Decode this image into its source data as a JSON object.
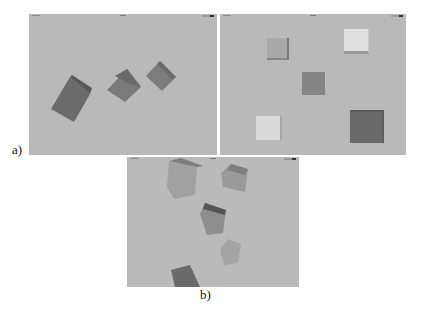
{
  "figure": {
    "label_a": "a)",
    "label_b": "b)"
  },
  "panels": [
    {
      "id": "a-left",
      "background": "#b9b9b9",
      "cube_count": 3
    },
    {
      "id": "a-right",
      "background": "#b9b9b9",
      "cube_count": 5
    },
    {
      "id": "b",
      "background": "#bababa",
      "cube_count": 5
    }
  ]
}
